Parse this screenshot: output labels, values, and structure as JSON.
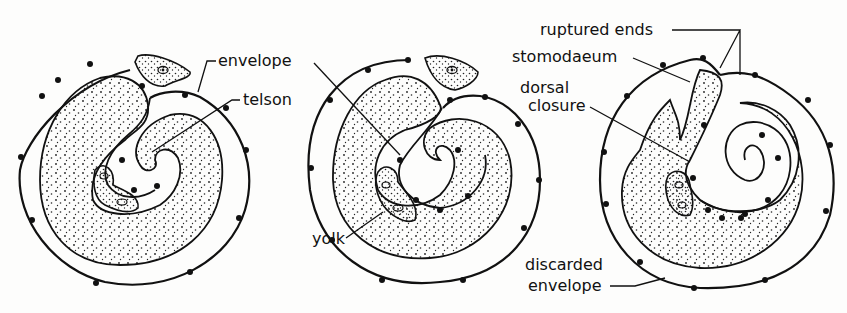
{
  "diagram": {
    "stages": [
      {
        "id": "stage-1",
        "labels": {
          "envelope": "envelope",
          "telson": "telson"
        }
      },
      {
        "id": "stage-2",
        "labels": {
          "yolk": "yolk"
        }
      },
      {
        "id": "stage-3",
        "labels": {
          "ruptured_ends": "ruptured ends",
          "stomodaeum": "stomodaeum",
          "dorsal_closure_1": "dorsal",
          "dorsal_closure_2": "closure",
          "discarded_envelope_1": "discarded",
          "discarded_envelope_2": "envelope"
        }
      }
    ],
    "colors": {
      "ink": "#111111",
      "paper": "#fdfdfc"
    }
  }
}
